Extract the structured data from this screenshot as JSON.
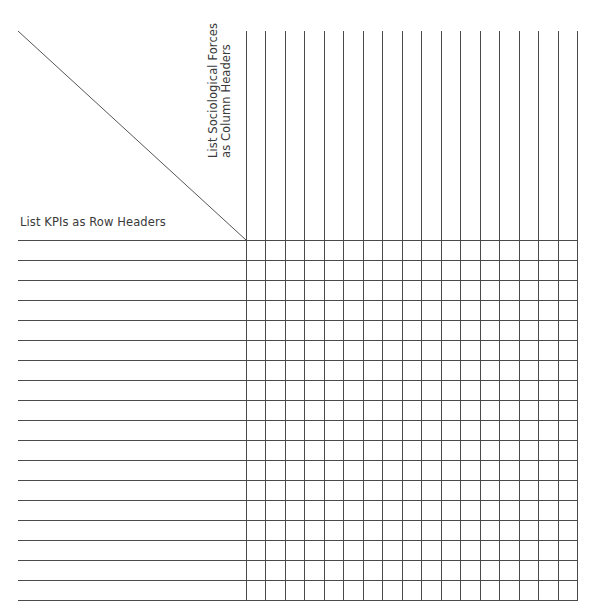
{
  "matrix": {
    "corner": {
      "row_header_instruction": "List KPIs as Row Headers",
      "column_header_instruction_line1": "List Sociological Forces",
      "column_header_instruction_line2": "as Column Headers"
    },
    "grid": {
      "columns": 17,
      "rows": 18,
      "line_color": "#4a4a4a"
    }
  }
}
